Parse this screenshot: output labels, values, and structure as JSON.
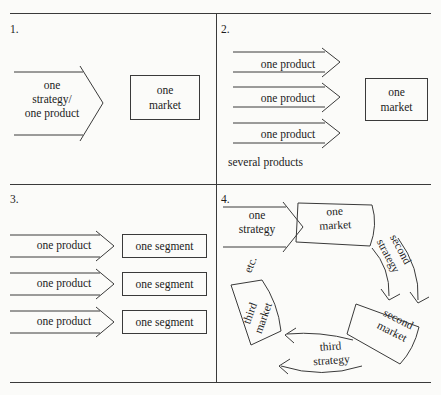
{
  "figure": {
    "background_color": "#fbfbf9",
    "line_color": "#3a3a3a",
    "text_color": "#1c1c1c"
  },
  "panels": [
    {
      "number": "1.",
      "arrow_label": "one\nstrategy/\none product",
      "box_label": "one\nmarket",
      "caption": ""
    },
    {
      "number": "2.",
      "arrow_labels": [
        "one product",
        "one product",
        "one product"
      ],
      "box_label": "one\nmarket",
      "caption": "several products"
    },
    {
      "number": "3.",
      "arrow_labels": [
        "one product",
        "one product",
        "one product"
      ],
      "box_labels": [
        "one segment",
        "one segment",
        "one segment"
      ],
      "caption": ""
    },
    {
      "number": "4.",
      "arrow_label": "one\nstrategy",
      "cycle_boxes": [
        "one\nmarket",
        "second\nmarket",
        "third\nmarket"
      ],
      "cycle_arrows": [
        "second\nstrategy",
        "third\nstrategy"
      ],
      "etc_label": "etc."
    }
  ]
}
